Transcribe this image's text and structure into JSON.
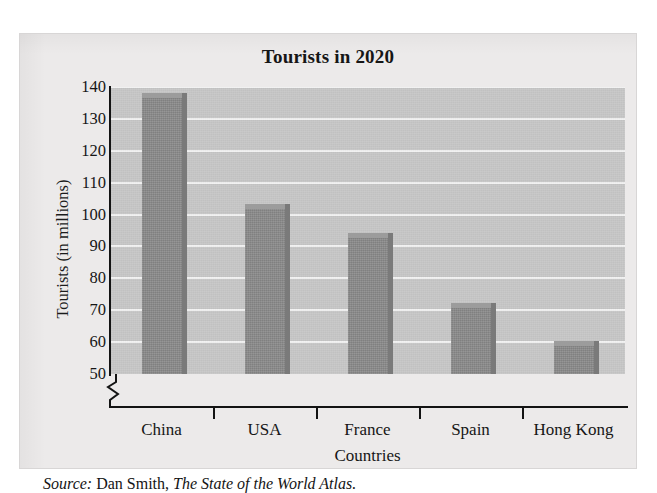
{
  "figure": {
    "title": "Tourists in 2020",
    "source_lead": "Source:",
    "source_author": "Dan Smith,",
    "source_work": "The State of the World Atlas."
  },
  "axes": {
    "y_title": "Tourists (in millions)",
    "x_title": "Countries",
    "y_ticks": [
      "140",
      "130",
      "120",
      "110",
      "100",
      "90",
      "80",
      "70",
      "60",
      "50"
    ],
    "break_symbol": "axis-break-zigzag"
  },
  "colors": {
    "panel": "#c7c7c7",
    "gridline": "#f2f2f2",
    "bar": "#8c8c8c",
    "bar_top": "#9c9c9c",
    "bar_side": "#7a7a7a",
    "axis": "#131313",
    "page": "#eceaea"
  },
  "chart_data": {
    "type": "bar",
    "title": "Tourists in 2020",
    "xlabel": "Countries",
    "ylabel": "Tourists (in millions)",
    "categories": [
      "China",
      "USA",
      "France",
      "Spain",
      "Hong Kong"
    ],
    "values": [
      137,
      102,
      93,
      71,
      59
    ],
    "ylim": [
      50,
      140
    ],
    "ytick_step": 10,
    "yticks": [
      50,
      60,
      70,
      80,
      90,
      100,
      110,
      120,
      130,
      140
    ],
    "y_axis_broken": true,
    "grid": "horizontal",
    "legend": "none",
    "source": "Source: Dan Smith, The State of the World Atlas."
  }
}
